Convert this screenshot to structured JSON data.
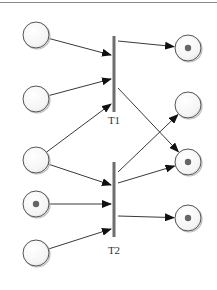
{
  "diagram": {
    "type": "petri-net",
    "transitions": [
      {
        "id": "T1",
        "label": "T1",
        "x": 114,
        "y1": 36,
        "y2": 112,
        "label_y": 124
      },
      {
        "id": "T2",
        "label": "T2",
        "x": 114,
        "y1": 162,
        "y2": 237,
        "label_y": 254
      }
    ],
    "places": [
      {
        "id": "p1",
        "x": 36,
        "y": 35,
        "tokens": 0
      },
      {
        "id": "p2",
        "x": 36,
        "y": 99,
        "tokens": 0
      },
      {
        "id": "p3",
        "x": 36,
        "y": 160,
        "tokens": 0
      },
      {
        "id": "p4",
        "x": 36,
        "y": 204,
        "tokens": 1
      },
      {
        "id": "p5",
        "x": 36,
        "y": 253,
        "tokens": 0
      },
      {
        "id": "p6",
        "x": 188,
        "y": 48,
        "tokens": 1
      },
      {
        "id": "p7",
        "x": 188,
        "y": 105,
        "tokens": 0
      },
      {
        "id": "p8",
        "x": 188,
        "y": 162,
        "tokens": 1
      },
      {
        "id": "p9",
        "x": 188,
        "y": 218,
        "tokens": 1
      }
    ],
    "arcs": [
      {
        "from": "p1",
        "to": "T1"
      },
      {
        "from": "p2",
        "to": "T1"
      },
      {
        "from": "p3",
        "to": "T1"
      },
      {
        "from": "T1",
        "to": "p6"
      },
      {
        "from": "T1",
        "to": "p8"
      },
      {
        "from": "p3",
        "to": "T2"
      },
      {
        "from": "p4",
        "to": "T2"
      },
      {
        "from": "p5",
        "to": "T2"
      },
      {
        "from": "T2",
        "to": "p7"
      },
      {
        "from": "T2",
        "to": "p8"
      },
      {
        "from": "T2",
        "to": "p9"
      }
    ],
    "colors": {
      "stroke": "#555555",
      "bar": "#6e6e6e",
      "token": "#666666"
    }
  }
}
